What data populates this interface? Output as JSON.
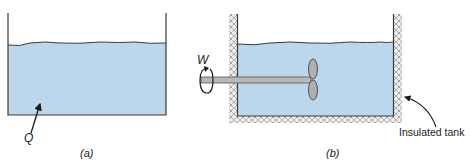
{
  "figure": {
    "panels": [
      {
        "id": "a",
        "caption": "(a)",
        "labels": {
          "heat": "Q"
        },
        "description": "Open tank of liquid with heat Q transferred into the liquid"
      },
      {
        "id": "b",
        "caption": "(b)",
        "labels": {
          "work": "W",
          "tank": "Insulated tank"
        },
        "description": "Insulated tank of liquid stirred by a paddle wheel driven by shaft work W"
      }
    ],
    "colors": {
      "liquid": "#bcd6ec",
      "wall": "#3a3a3a",
      "insulation": "#d9d9d9",
      "shaft": "#b5b5b5",
      "text": "#1a1a1a"
    }
  }
}
